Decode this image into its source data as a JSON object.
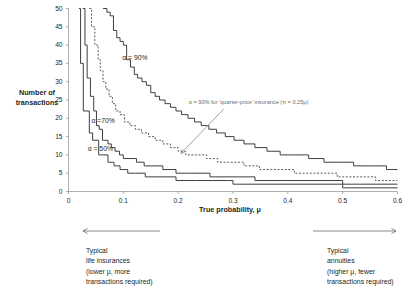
{
  "chart_data": {
    "type": "line",
    "title": "",
    "xlabel": "True probability, μ",
    "ylabel": "Number of transactions",
    "xlim": [
      0,
      0.6
    ],
    "ylim": [
      0,
      50
    ],
    "xticks": [
      "0",
      "0.1",
      "0.2",
      "0.3",
      "0.4",
      "0.5",
      "0.6"
    ],
    "xtick_values": [
      0,
      0.1,
      0.2,
      0.3,
      0.4,
      0.5,
      0.6
    ],
    "yticks": [
      "0",
      "5",
      "10",
      "15",
      "20",
      "25",
      "30",
      "35",
      "40",
      "45",
      "50"
    ],
    "ytick_values": [
      0,
      5,
      10,
      15,
      20,
      25,
      30,
      35,
      40,
      45,
      50
    ],
    "grid": false,
    "legend_position": "inline-annotations",
    "series": [
      {
        "name": "α = 50%",
        "style": "solid",
        "label": "α = 50%",
        "label_x": 0.035,
        "label_y": 11.6,
        "points": [
          [
            0.019,
            50
          ],
          [
            0.022,
            35
          ],
          [
            0.027,
            22
          ],
          [
            0.038,
            16
          ],
          [
            0.044,
            14
          ],
          [
            0.052,
            14
          ],
          [
            0.055,
            10
          ],
          [
            0.062,
            10
          ],
          [
            0.072,
            8
          ],
          [
            0.083,
            7
          ],
          [
            0.094,
            6
          ],
          [
            0.108,
            5
          ],
          [
            0.122,
            5
          ],
          [
            0.14,
            4
          ],
          [
            0.165,
            4
          ],
          [
            0.196,
            3
          ],
          [
            0.232,
            3
          ],
          [
            0.29,
            3
          ],
          [
            0.3,
            2
          ],
          [
            0.34,
            2
          ],
          [
            0.455,
            2
          ],
          [
            0.5,
            1
          ],
          [
            0.6,
            1
          ]
        ]
      },
      {
        "name": "α = 70%",
        "style": "solid",
        "label": "α =70%",
        "label_x": 0.042,
        "label_y": 19.2,
        "points": [
          [
            0.026,
            50
          ],
          [
            0.03,
            40
          ],
          [
            0.034,
            31
          ],
          [
            0.04,
            26
          ],
          [
            0.046,
            22
          ],
          [
            0.051,
            18
          ],
          [
            0.056,
            17
          ],
          [
            0.062,
            14
          ],
          [
            0.072,
            13
          ],
          [
            0.078,
            12
          ],
          [
            0.085,
            11
          ],
          [
            0.093,
            10
          ],
          [
            0.1,
            9
          ],
          [
            0.112,
            9
          ],
          [
            0.124,
            8
          ],
          [
            0.138,
            7
          ],
          [
            0.152,
            7
          ],
          [
            0.172,
            6
          ],
          [
            0.196,
            5
          ],
          [
            0.222,
            5
          ],
          [
            0.258,
            4
          ],
          [
            0.3,
            4
          ],
          [
            0.34,
            3
          ],
          [
            0.4,
            3
          ],
          [
            0.455,
            3
          ],
          [
            0.5,
            2
          ],
          [
            0.53,
            2
          ],
          [
            0.6,
            2
          ]
        ]
      },
      {
        "name": "α = 90% for 'quarter-price' insurance",
        "style": "dashed",
        "label": "",
        "points": [
          [
            0.038,
            50
          ],
          [
            0.042,
            45
          ],
          [
            0.048,
            40
          ],
          [
            0.054,
            36
          ],
          [
            0.058,
            33
          ],
          [
            0.063,
            30
          ],
          [
            0.068,
            28
          ],
          [
            0.074,
            26
          ],
          [
            0.08,
            24
          ],
          [
            0.086,
            22
          ],
          [
            0.094,
            21
          ],
          [
            0.102,
            19
          ],
          [
            0.112,
            18
          ],
          [
            0.122,
            17
          ],
          [
            0.133,
            16
          ],
          [
            0.146,
            15
          ],
          [
            0.158,
            14
          ],
          [
            0.172,
            13
          ],
          [
            0.186,
            12
          ],
          [
            0.2,
            11
          ],
          [
            0.214,
            10
          ],
          [
            0.232,
            10
          ],
          [
            0.252,
            9
          ],
          [
            0.272,
            8
          ],
          [
            0.296,
            8
          ],
          [
            0.32,
            7
          ],
          [
            0.348,
            6
          ],
          [
            0.38,
            6
          ],
          [
            0.412,
            5
          ],
          [
            0.45,
            5
          ],
          [
            0.49,
            4
          ],
          [
            0.53,
            4
          ],
          [
            0.56,
            3
          ],
          [
            0.6,
            3
          ]
        ]
      },
      {
        "name": "α = 90%",
        "style": "solid",
        "label": "α = 90%",
        "label_x": 0.098,
        "label_y": 36.5,
        "points": [
          [
            0.063,
            50
          ],
          [
            0.07,
            49
          ],
          [
            0.076,
            48
          ],
          [
            0.082,
            44
          ],
          [
            0.088,
            42
          ],
          [
            0.094,
            41
          ],
          [
            0.1,
            40
          ],
          [
            0.106,
            36
          ],
          [
            0.113,
            34
          ],
          [
            0.12,
            32
          ],
          [
            0.126,
            31
          ],
          [
            0.134,
            30
          ],
          [
            0.142,
            29
          ],
          [
            0.15,
            27
          ],
          [
            0.158,
            26
          ],
          [
            0.166,
            25
          ],
          [
            0.176,
            24
          ],
          [
            0.186,
            23
          ],
          [
            0.196,
            22
          ],
          [
            0.206,
            21
          ],
          [
            0.218,
            20
          ],
          [
            0.23,
            19
          ],
          [
            0.242,
            18
          ],
          [
            0.256,
            17
          ],
          [
            0.27,
            16
          ],
          [
            0.286,
            15
          ],
          [
            0.302,
            14
          ],
          [
            0.32,
            13
          ],
          [
            0.34,
            12
          ],
          [
            0.362,
            11
          ],
          [
            0.386,
            10
          ],
          [
            0.412,
            10
          ],
          [
            0.438,
            9
          ],
          [
            0.466,
            8
          ],
          [
            0.494,
            8
          ],
          [
            0.52,
            7
          ],
          [
            0.552,
            7
          ],
          [
            0.58,
            6
          ],
          [
            0.6,
            6
          ]
        ]
      }
    ],
    "annotations": [
      {
        "name": "quarter-price-callout",
        "text": "α = 90% for 'quarter-price' insurance  (π = 0.25μ)",
        "arrow_from": [
          0.283,
          22.5
        ],
        "arrow_to": [
          0.205,
          10.4
        ]
      }
    ]
  },
  "footnotes": {
    "left": {
      "arrow_direction": "left",
      "lines": [
        "Typical",
        "life insurances",
        "(lower μ, more",
        "transactions required)"
      ]
    },
    "right": {
      "arrow_direction": "right",
      "lines": [
        "Typical",
        "annuities",
        "(higher μ, fewer",
        "transactions required)"
      ]
    }
  },
  "colors": {
    "curve": "#3f3f3f",
    "axis": "#9a9a9a",
    "text": "#231f20",
    "annotation": "#7a7a7a",
    "background": "#ffffff"
  }
}
